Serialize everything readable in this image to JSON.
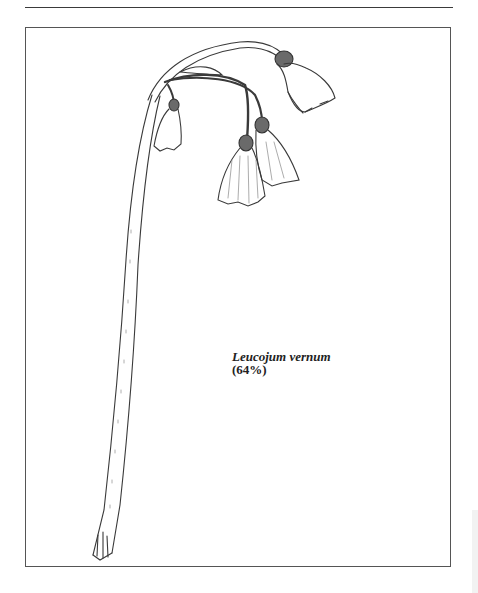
{
  "page": {
    "rule": "top-horizontal-rule",
    "illustration": {
      "subject": "botanical line drawing of a flowering stem with nodding bell-shaped flowers",
      "caption": {
        "name": "Leucojum vernum",
        "scale": "(64%)"
      }
    }
  }
}
